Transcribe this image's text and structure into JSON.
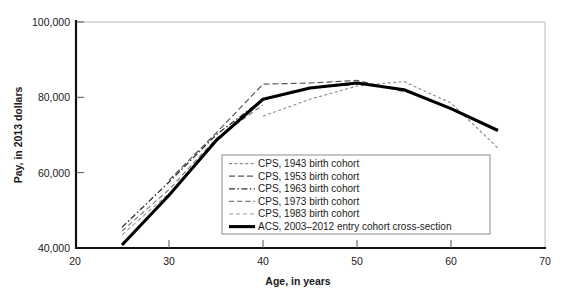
{
  "chart_data": {
    "type": "line",
    "title": "",
    "xlabel": "Age, in years",
    "ylabel": "Pay, in 2013 dollars",
    "xlim": [
      20,
      70
    ],
    "ylim": [
      40000,
      100000
    ],
    "xticks": [
      "20",
      "30",
      "40",
      "50",
      "60",
      "70"
    ],
    "yticks": [
      "40,000",
      "60,000",
      "80,000",
      "100,000"
    ],
    "grid": false,
    "legend_position": "center-right-inside",
    "series": [
      {
        "name": "CPS, 1943 birth cohort",
        "style": "fine-dotted",
        "color": "#8a8a8a",
        "x": [
          40,
          45,
          50,
          55,
          60,
          65
        ],
        "y": [
          75000,
          79500,
          83000,
          84200,
          78500,
          66500
        ]
      },
      {
        "name": "CPS, 1953 birth cohort",
        "style": "medium-dash",
        "color": "#555555",
        "x": [
          30,
          35,
          40,
          45,
          50,
          55
        ],
        "y": [
          58000,
          70500,
          83500,
          83800,
          84500,
          81500
        ]
      },
      {
        "name": "CPS, 1963 birth cohort",
        "style": "dash-dot",
        "color": "#333333",
        "x": [
          25,
          30,
          35,
          40,
          45,
          50
        ],
        "y": [
          45500,
          57500,
          70000,
          79500,
          82500,
          83500
        ]
      },
      {
        "name": "CPS, 1973 birth cohort",
        "style": "light-dash",
        "color": "#777777",
        "x": [
          25,
          30,
          35,
          40
        ],
        "y": [
          44500,
          55500,
          69000,
          78000
        ]
      },
      {
        "name": "CPS, 1983 birth cohort",
        "style": "light-dash-2",
        "color": "#9a9a9a",
        "x": [
          25,
          30
        ],
        "y": [
          43500,
          54500
        ]
      },
      {
        "name": "ACS, 2003–2012 entry cohort cross-section",
        "style": "solid-thick",
        "color": "#000000",
        "x": [
          25,
          30,
          35,
          40,
          45,
          50,
          55,
          60,
          65
        ],
        "y": [
          40800,
          54000,
          68500,
          79500,
          82500,
          83800,
          82000,
          77000,
          71200
        ]
      }
    ],
    "legend_entries": [
      {
        "label": "CPS, 1943 birth cohort",
        "style": "fine-dotted"
      },
      {
        "label": "CPS, 1953 birth cohort",
        "style": "medium-dash"
      },
      {
        "label": "CPS, 1963 birth cohort",
        "style": "dash-dot"
      },
      {
        "label": "CPS, 1973 birth cohort",
        "style": "light-dash"
      },
      {
        "label": "CPS, 1983 birth cohort",
        "style": "light-dash-2"
      },
      {
        "label": "ACS, 2003–2012 entry cohort cross-section",
        "style": "solid-thick"
      }
    ]
  }
}
